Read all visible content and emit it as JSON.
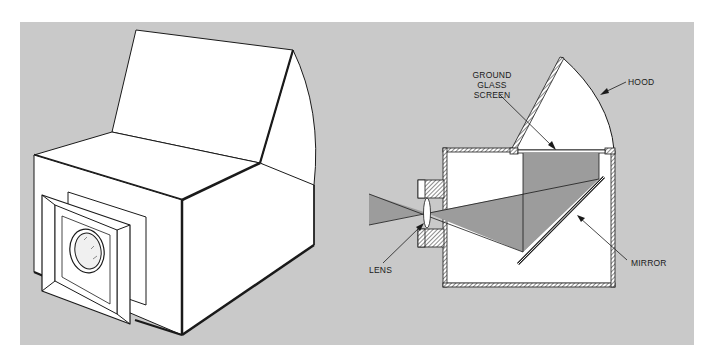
{
  "figure": {
    "background_color": "#c9c9c9",
    "line_color": "#1a1a1a",
    "beam_color": "#9c9c9c",
    "left_illustration": {
      "description": "Isometric view of box camera with open hood and lens on front face"
    },
    "right_illustration": {
      "description": "Cross-section of reflex box camera",
      "labels": {
        "ground_glass": [
          "GROUND",
          "GLASS",
          "SCREEN"
        ],
        "hood": "HOOD",
        "lens": "LENS",
        "mirror": "MIRROR"
      }
    }
  }
}
